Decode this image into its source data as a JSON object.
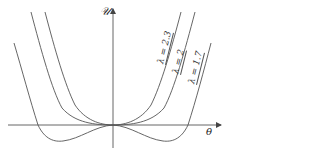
{
  "figure": {
    "y_axis_label": "𝒰",
    "x_axis_label": "θ",
    "curves": [
      {
        "label": "λ = 2.3",
        "lambda": 2.3
      },
      {
        "label": "λ = 2",
        "lambda": 2
      },
      {
        "label": "λ = 1.7",
        "lambda": 1.7
      }
    ]
  },
  "colors": {
    "line": "#555555",
    "axis": "#666666",
    "background": "#ffffff"
  }
}
